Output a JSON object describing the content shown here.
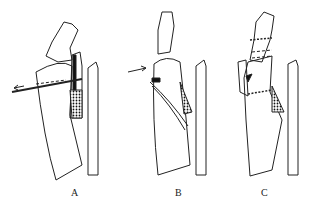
{
  "figure": {
    "panels": [
      {
        "label": "A",
        "description": "Bone with transverse drill/wire passing through, arrow pointing left"
      },
      {
        "label": "B",
        "description": "Bone with arrow pointing right at fracture edge, ligament strands"
      },
      {
        "label": "C",
        "description": "Bone with dashed osteotomy lines and displaced fragment"
      }
    ]
  }
}
